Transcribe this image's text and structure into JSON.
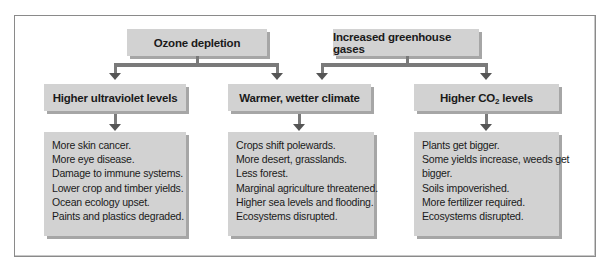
{
  "diagram": {
    "causes": [
      {
        "id": "ozone",
        "label": "Ozone depletion"
      },
      {
        "id": "greenhouse",
        "label": "Increased greenhouse gases"
      }
    ],
    "effects": [
      {
        "id": "uv",
        "label": "Higher ultraviolet levels",
        "from": [
          "ozone"
        ],
        "consequences": [
          "More skin cancer.",
          "More eye disease.",
          "Damage to immune systems.",
          "Lower crop and timber yields.",
          "Ocean ecology upset.",
          "Paints and plastics degraded."
        ]
      },
      {
        "id": "climate",
        "label": "Warmer, wetter climate",
        "from": [
          "ozone",
          "greenhouse"
        ],
        "consequences": [
          "Crops shift polewards.",
          "More desert, grasslands.",
          "Less forest.",
          "Marginal agriculture threatened.",
          "Higher sea levels and flooding.",
          "Ecosystems disrupted."
        ]
      },
      {
        "id": "co2",
        "label_prefix": "Higher CO",
        "label_sub": "2",
        "label_suffix": " levels",
        "from": [
          "greenhouse"
        ],
        "consequences": [
          "Plants get bigger.",
          "Some yields increase, weeds get",
          "bigger.",
          "Soils impoverished.",
          "More fertilizer required.",
          "Ecosystems disrupted."
        ]
      }
    ]
  },
  "colors": {
    "box_fill": "#d2d2d2",
    "box_shadow": "#a6a6a6",
    "connector": "#7a7a7a",
    "arrow": "#555555",
    "frame": "#8a8a8a"
  }
}
